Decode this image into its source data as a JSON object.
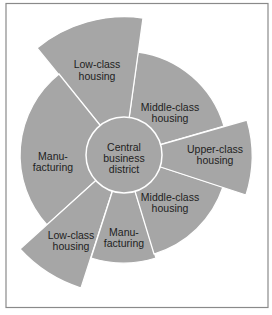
{
  "colors": {
    "sector_fill": "#a6a6a6",
    "divider": "#ffffff",
    "text": "#1e1e1e",
    "frame": "#8a8a8a",
    "background": "#ffffff"
  },
  "diagram": {
    "type": "multiple-nuclei urban land-use model",
    "center": {
      "lines": [
        "Central",
        "business",
        "district"
      ]
    },
    "sectors": [
      {
        "id": "middle-class-upper",
        "lines": [
          "Middle-class",
          "housing"
        ]
      },
      {
        "id": "low-class-upper",
        "lines": [
          "Low-class",
          "housing"
        ]
      },
      {
        "id": "manufacturing-left",
        "lines": [
          "Manu-",
          "facturing"
        ]
      },
      {
        "id": "low-class-lower",
        "lines": [
          "Low-class",
          "housing"
        ]
      },
      {
        "id": "manufacturing-lower",
        "lines": [
          "Manu-",
          "facturing"
        ]
      },
      {
        "id": "middle-class-lower",
        "lines": [
          "Middle-class",
          "housing"
        ]
      },
      {
        "id": "upper-class",
        "lines": [
          "Upper-class",
          "housing"
        ]
      }
    ]
  }
}
